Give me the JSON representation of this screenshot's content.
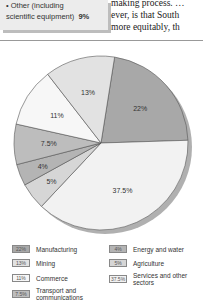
{
  "sidebox": {
    "line1": "• Other (including",
    "line2": "scientific equipment)",
    "line2_pct": "9%"
  },
  "body_text": {
    "lines": [
      "making process. …",
      "ever, is that South",
      "more equitably, th"
    ]
  },
  "chart_data": {
    "type": "pie",
    "title": "",
    "slices": [
      {
        "label": "Manufacturing",
        "value": 22,
        "display": "22%",
        "color": "#a8a8a8"
      },
      {
        "label": "Services and other sectors",
        "value": 37.5,
        "display": "37.5%",
        "color": "#f2f2f2"
      },
      {
        "label": "Agriculture",
        "value": 5,
        "display": "5%",
        "color": "#d6d6d6"
      },
      {
        "label": "Energy and water",
        "value": 4,
        "display": "4%",
        "color": "#b4b4b4"
      },
      {
        "label": "Transport and communications",
        "value": 7.5,
        "display": "7.5%",
        "color": "#bdbdbd"
      },
      {
        "label": "Commerce",
        "value": 11,
        "display": "11%",
        "color": "#f7f7f7"
      },
      {
        "label": "Mining",
        "value": 13,
        "display": "13%",
        "color": "#e2e2e2"
      }
    ],
    "start_angle_deg": 9,
    "legend_position": "bottom"
  },
  "legend": {
    "items": [
      {
        "swatch": "22%",
        "label": "Manufacturing",
        "color": "#a8a8a8"
      },
      {
        "swatch": "13%",
        "label": "Mining",
        "color": "#e2e2e2"
      },
      {
        "swatch": "11%",
        "label": "Commerce",
        "color": "#f7f7f7"
      },
      {
        "swatch": "7.5%",
        "label": "Transport and communications",
        "color": "#bdbdbd"
      },
      {
        "swatch": "4%",
        "label": "Energy and water",
        "color": "#b4b4b4"
      },
      {
        "swatch": "5%",
        "label": "Agriculture",
        "color": "#d6d6d6"
      },
      {
        "swatch": "37.5%",
        "label": "Services and other sectors",
        "color": "#f2f2f2"
      }
    ]
  }
}
